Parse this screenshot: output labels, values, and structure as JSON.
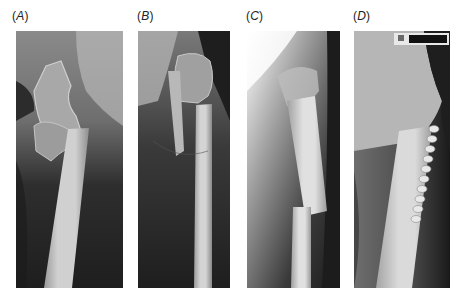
{
  "figure": {
    "panels": [
      {
        "id": "A",
        "label": "(A)",
        "description": "Radiograph: proximal femur with subtrochanteric fracture, displaced shaft"
      },
      {
        "id": "B",
        "label": "(B)",
        "description": "Radiograph: proximal femur fracture, shaft medially displaced"
      },
      {
        "id": "C",
        "label": "(C)",
        "description": "Radiograph: lateral view of femoral shaft fracture with step-off"
      },
      {
        "id": "D",
        "label": "(D)",
        "description": "Radiograph: fixation with lateral plate and screws, marker at top"
      }
    ],
    "colors": {
      "background": "#ffffff",
      "film_dark": "#1c1c1c",
      "film_mid": "#5a5a5a",
      "bone": "#d8d8d8"
    }
  }
}
